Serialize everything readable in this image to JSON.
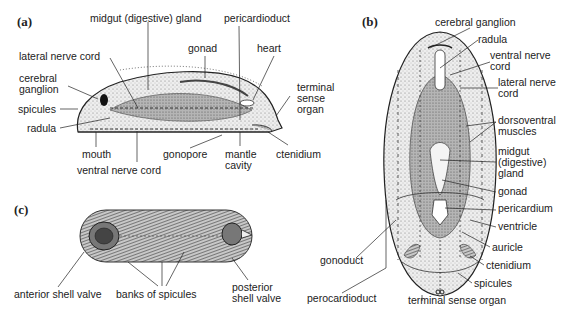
{
  "figure": {
    "panels": [
      {
        "id": "a",
        "label": "(a)",
        "view": "lateral section",
        "annotations": [
          "midgut (digestive) gland",
          "pericardioduct",
          "gonad",
          "heart",
          "lateral nerve cord",
          "cerebral ganglion",
          "spicules",
          "radula",
          "terminal sense organ",
          "mouth",
          "gonopore",
          "mantle cavity",
          "ctenidium",
          "ventral nerve cord"
        ]
      },
      {
        "id": "b",
        "label": "(b)",
        "view": "dorsal view",
        "annotations": [
          "cerebral ganglion",
          "radula",
          "ventral nerve cord",
          "lateral nerve cord",
          "dorsoventral muscles",
          "midgut (digestive) gland",
          "gonad",
          "pericardium",
          "ventricle",
          "auricle",
          "ctenidium",
          "spicules",
          "terminal sense organ",
          "gonoduct",
          "perocardioduct"
        ]
      },
      {
        "id": "c",
        "label": "(c)",
        "view": "external dorsal view",
        "annotations": [
          "anterior shell valve",
          "banks of spicules",
          "posterior shell valve"
        ]
      }
    ]
  },
  "a": {
    "label": "(a)",
    "midgut": "midgut (digestive) gland",
    "pericardioduct": "pericardioduct",
    "gonad": "gonad",
    "heart": "heart",
    "lateral_nerve": "lateral nerve cord",
    "cerebral1": "cerebral",
    "cerebral2": "ganglion",
    "spicules": "spicules",
    "radula": "radula",
    "tso1": "terminal",
    "tso2": "sense",
    "tso3": "organ",
    "mouth": "mouth",
    "gonopore": "gonopore",
    "mantle1": "mantle",
    "mantle2": "cavity",
    "ctenidium": "ctenidium",
    "ventral_nerve": "ventral nerve cord"
  },
  "b": {
    "label": "(b)",
    "cerebral": "cerebral ganglion",
    "radula": "radula",
    "ventral1": "ventral nerve",
    "ventral2": "cord",
    "lateral1": "lateral nerve",
    "lateral2": "cord",
    "dv1": "dorsoventral",
    "dv2": "muscles",
    "midgut1": "midgut",
    "midgut2": "(digestive)",
    "midgut3": "gland",
    "gonad": "gonad",
    "pericardium": "pericardium",
    "ventricle": "ventricle",
    "auricle": "auricle",
    "ctenidium": "ctenidium",
    "spicules": "spicules",
    "tso": "terminal sense organ",
    "gonoduct": "gonoduct",
    "perocardioduct": "perocardioduct"
  },
  "c": {
    "label": "(c)",
    "anterior": "anterior shell valve",
    "banks": "banks of spicules",
    "posterior1": "posterior",
    "posterior2": "shell valve"
  }
}
